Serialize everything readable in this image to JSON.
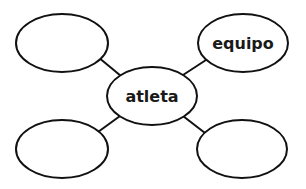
{
  "diagram": {
    "type": "word-web",
    "center": {
      "id": "center",
      "label": "atleta",
      "cx": 152,
      "cy": 96,
      "rx": 45,
      "ry": 29
    },
    "nodes": [
      {
        "id": "top-left",
        "label": "",
        "cx": 62,
        "cy": 43,
        "rx": 46,
        "ry": 29
      },
      {
        "id": "top-right",
        "label": "equipo",
        "cx": 243,
        "cy": 43,
        "rx": 45,
        "ry": 29
      },
      {
        "id": "bottom-left",
        "label": "",
        "cx": 62,
        "cy": 149,
        "rx": 46,
        "ry": 29
      },
      {
        "id": "bottom-right",
        "label": "",
        "cx": 242,
        "cy": 149,
        "rx": 45,
        "ry": 29
      }
    ],
    "connectors": [
      {
        "from": "center",
        "to": "top-left",
        "x1": 121,
        "y1": 76,
        "x2": 98,
        "y2": 57
      },
      {
        "from": "center",
        "to": "top-right",
        "x1": 183,
        "y1": 75,
        "x2": 206,
        "y2": 60
      },
      {
        "from": "center",
        "to": "bottom-left",
        "x1": 120,
        "y1": 116,
        "x2": 98,
        "y2": 132
      },
      {
        "from": "center",
        "to": "bottom-right",
        "x1": 183,
        "y1": 116,
        "x2": 205,
        "y2": 133
      }
    ],
    "colors": {
      "stroke": "#111111",
      "fill": "#ffffff",
      "text": "#1a1a1a"
    }
  }
}
